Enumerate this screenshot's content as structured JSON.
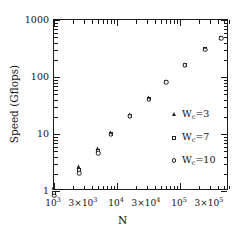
{
  "chart_data": {
    "type": "scatter",
    "title": "",
    "xlabel": "N",
    "ylabel": "Speed  (Gflops)",
    "xscale": "log",
    "yscale": "log",
    "xlim": [
      1000,
      600000
    ],
    "ylim": [
      1,
      1000
    ],
    "grid": false,
    "legend_position": "right-center",
    "x_tick_labels": [
      "10",
      "3×10",
      "10",
      "3×10",
      "10",
      "3×10"
    ],
    "x_tick_values": [
      1000,
      3000,
      10000,
      30000,
      100000,
      300000
    ],
    "x_tick_exponents": [
      "3",
      "3",
      "4",
      "4",
      "5",
      "5"
    ],
    "y_tick_labels": [
      "1",
      "10",
      "100",
      "1000"
    ],
    "y_tick_values": [
      1,
      10,
      100,
      1000
    ],
    "x": [
      1000,
      2500,
      5000,
      8000,
      16000,
      32000,
      60000,
      120000,
      250000,
      450000
    ],
    "series": [
      {
        "name": "Wc=3",
        "label_main": "W",
        "label_sub": "c",
        "label_tail": "=3",
        "marker": "triangle",
        "values": [
          1.15,
          2.6,
          5.4,
          10.5,
          21.5,
          42,
          83,
          165,
          310,
          490
        ]
      },
      {
        "name": "Wc=7",
        "label_main": "W",
        "label_sub": "c",
        "label_tail": "=7",
        "marker": "square",
        "values": [
          0.93,
          2.35,
          5.1,
          10.0,
          21.0,
          41,
          82,
          163,
          305,
          480
        ]
      },
      {
        "name": "Wc=10",
        "label_main": "W",
        "label_sub": "c",
        "label_tail": "=10",
        "marker": "circle",
        "values": [
          0.82,
          2.05,
          4.6,
          9.7,
          20.5,
          40,
          81,
          161,
          300,
          475
        ]
      }
    ]
  },
  "axes": {
    "x_title": "N",
    "y_title": "Speed  (Gflops)"
  },
  "legend": {
    "items": [
      {
        "marker": "triangle",
        "main": "W",
        "sub": "c",
        "tail": "=3"
      },
      {
        "marker": "square",
        "main": "W",
        "sub": "c",
        "tail": "=7"
      },
      {
        "marker": "circle",
        "main": "W",
        "sub": "c",
        "tail": "=10"
      }
    ]
  }
}
